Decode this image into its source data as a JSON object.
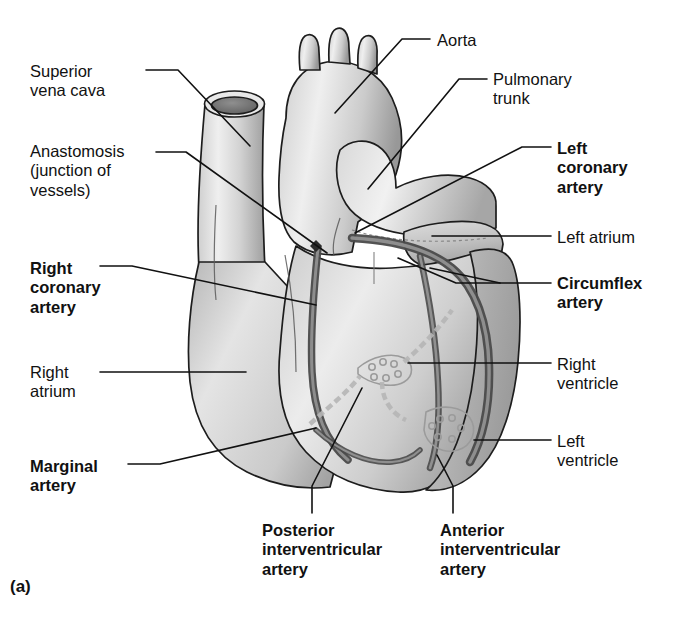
{
  "figure": {
    "caption": "(a)",
    "background_color": "#ffffff",
    "ink_color": "#111111",
    "vessel_color": "#6d6d6d",
    "myocardium_light": "#e3e3e3",
    "myocardium_mid": "#c9c9c9",
    "myocardium_dark": "#9a9a9a"
  },
  "labels": [
    {
      "id": "superior-vena-cava",
      "text": "Superior\nvena cava",
      "bold": false,
      "align": "left",
      "x": 30,
      "y": 62
    },
    {
      "id": "anastomosis",
      "text": "Anastomosis\n(junction of\nvessels)",
      "bold": false,
      "align": "left",
      "x": 30,
      "y": 142
    },
    {
      "id": "right-coronary-artery",
      "text": "Right\ncoronary\nartery",
      "bold": true,
      "align": "left",
      "x": 30,
      "y": 259
    },
    {
      "id": "right-atrium",
      "text": "Right\natrium",
      "bold": false,
      "align": "left",
      "x": 30,
      "y": 363
    },
    {
      "id": "marginal-artery",
      "text": "Marginal\nartery",
      "bold": true,
      "align": "left",
      "x": 30,
      "y": 457
    },
    {
      "id": "aorta",
      "text": "Aorta",
      "bold": false,
      "align": "left",
      "x": 437,
      "y": 31
    },
    {
      "id": "pulmonary-trunk",
      "text": "Pulmonary\ntrunk",
      "bold": false,
      "align": "left",
      "x": 493,
      "y": 70
    },
    {
      "id": "left-coronary-artery",
      "text": "Left\ncoronary\nartery",
      "bold": true,
      "align": "left",
      "x": 557,
      "y": 139
    },
    {
      "id": "left-atrium",
      "text": "Left atrium",
      "bold": false,
      "align": "left",
      "x": 557,
      "y": 228
    },
    {
      "id": "circumflex-artery",
      "text": "Circumflex\nartery",
      "bold": true,
      "align": "left",
      "x": 557,
      "y": 274
    },
    {
      "id": "right-ventricle",
      "text": "Right\nventricle",
      "bold": false,
      "align": "left",
      "x": 557,
      "y": 355
    },
    {
      "id": "left-ventricle",
      "text": "Left\nventricle",
      "bold": false,
      "align": "left",
      "x": 557,
      "y": 432
    },
    {
      "id": "posterior-interventricular-artery",
      "text": "Posterior\ninterventricular\nartery",
      "bold": true,
      "align": "left",
      "x": 262,
      "y": 521
    },
    {
      "id": "anterior-interventricular-artery",
      "text": "Anterior\ninterventricular\nartery",
      "bold": true,
      "align": "left",
      "x": 440,
      "y": 521
    }
  ],
  "leader_lines": [
    {
      "id": "leader-superior-vena-cava",
      "points": "146,70 178,70 250,146"
    },
    {
      "id": "leader-anastomosis",
      "points": "156,152 186,152 327,253"
    },
    {
      "id": "leader-right-coronary-artery",
      "points": "100,266 132,266 316,305"
    },
    {
      "id": "leader-right-atrium",
      "points": "100,372 246,372"
    },
    {
      "id": "leader-marginal-artery",
      "points": "128,464 160,464 316,428"
    },
    {
      "id": "leader-aorta",
      "points": "430,39 402,39 335,113"
    },
    {
      "id": "leader-pulmonary-trunk",
      "points": "487,79 459,79 368,189"
    },
    {
      "id": "leader-left-coronary-artery",
      "points": "551,147 522,147 355,233"
    },
    {
      "id": "leader-left-atrium",
      "points": "551,236 432,236"
    },
    {
      "id": "leader-circumflex-artery",
      "points": "551,283 456,283 398,258"
    },
    {
      "id": "leader-circumflex-artery-2",
      "points": "500,283 430,268"
    },
    {
      "id": "leader-right-ventricle",
      "points": "551,363 408,363"
    },
    {
      "id": "leader-left-ventricle",
      "points": "551,440 474,440"
    },
    {
      "id": "leader-posterior-iv-artery",
      "points": "312,513 312,486 362,388"
    },
    {
      "id": "leader-anterior-iv-artery",
      "points": "453,513 453,486 437,455"
    }
  ]
}
